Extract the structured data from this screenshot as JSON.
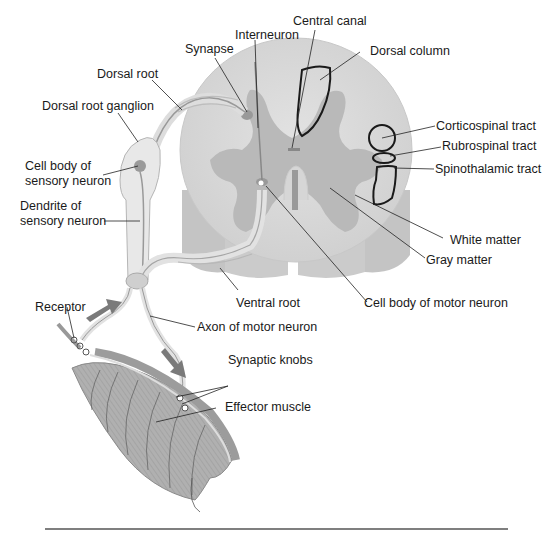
{
  "diagram": {
    "labels": {
      "central_canal": "Central canal",
      "interneuron": "Interneuron",
      "synapse": "Synapse",
      "dorsal_column": "Dorsal column",
      "dorsal_root": "Dorsal root",
      "dorsal_root_ganglion": "Dorsal root ganglion",
      "cell_body_sensory_1": "Cell body of",
      "cell_body_sensory_2": "sensory neuron",
      "dendrite_sensory_1": "Dendrite of",
      "dendrite_sensory_2": "sensory neuron",
      "corticospinal_tract": "Corticospinal tract",
      "rubrospinal_tract": "Rubrospinal tract",
      "spinothalamic_tract": "Spinothalamic tract",
      "white_matter": "White matter",
      "gray_matter": "Gray matter",
      "ventral_root": "Ventral root",
      "cell_body_motor": "Cell body of motor neuron",
      "receptor": "Receptor",
      "axon_motor": "Axon of motor neuron",
      "synaptic_knobs": "Synaptic knobs",
      "effector_muscle": "Effector muscle"
    },
    "colors": {
      "white_matter": "#d9d9d9",
      "gray_matter": "#bdbdbd",
      "outline": "#1a1a1a",
      "nerve": "#e8e8e8",
      "muscle": "#a8a8a8",
      "arrow": "#7a7a7a",
      "rule": "#555555"
    }
  }
}
